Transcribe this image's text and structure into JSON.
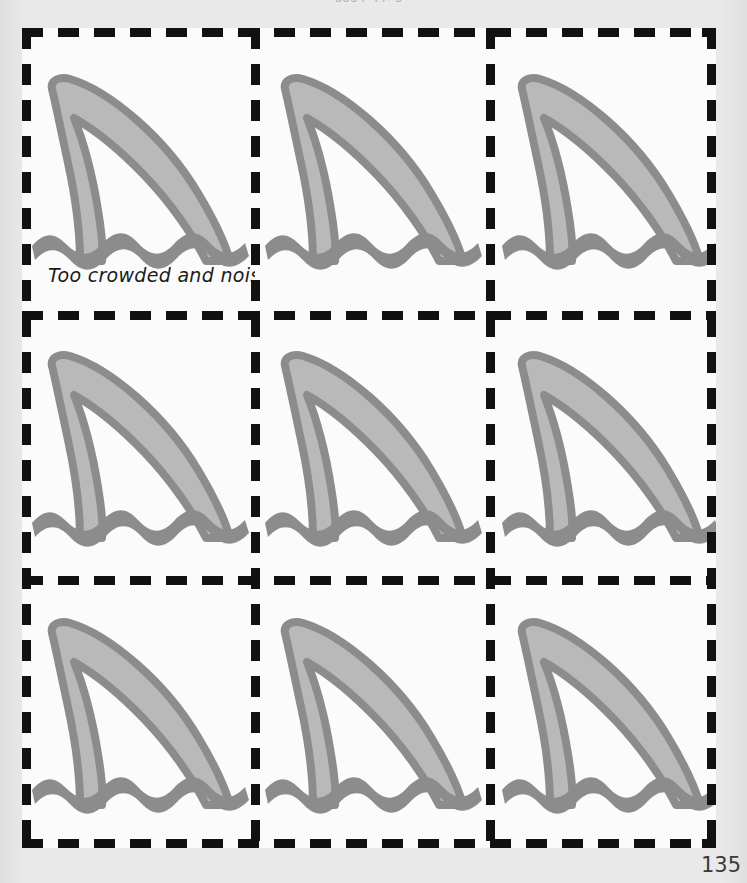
{
  "page": {
    "header_text": "ggg p  (        ),  g                        ,             ",
    "page_number": "135",
    "background_color": "#e9e9e9",
    "sheet_color": "#fbfbfb"
  },
  "colors": {
    "border": "#111111",
    "fin_fill": "#b9b9b9",
    "fin_outline": "#8c8c8c",
    "water": "#8c8c8c",
    "note_text": "#1b1b1b"
  },
  "worksheet": {
    "grid_rows": 3,
    "grid_columns": 3,
    "border_style": "dashed",
    "cells": [
      {
        "id": "cell-1",
        "icon": "shark-fin-icon",
        "note": "Too crowded and noisy."
      },
      {
        "id": "cell-2",
        "icon": "shark-fin-icon",
        "note": ""
      },
      {
        "id": "cell-3",
        "icon": "shark-fin-icon",
        "note": ""
      },
      {
        "id": "cell-4",
        "icon": "shark-fin-icon",
        "note": ""
      },
      {
        "id": "cell-5",
        "icon": "shark-fin-icon",
        "note": ""
      },
      {
        "id": "cell-6",
        "icon": "shark-fin-icon",
        "note": ""
      },
      {
        "id": "cell-7",
        "icon": "shark-fin-icon",
        "note": ""
      },
      {
        "id": "cell-8",
        "icon": "shark-fin-icon",
        "note": ""
      },
      {
        "id": "cell-9",
        "icon": "shark-fin-icon",
        "note": ""
      }
    ]
  }
}
